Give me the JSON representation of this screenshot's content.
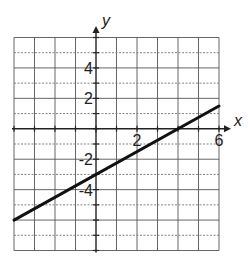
{
  "chart_data": {
    "type": "line",
    "title": "",
    "xlabel": "x",
    "ylabel": "y",
    "xlim": [
      -4,
      6
    ],
    "ylim": [
      -8,
      6
    ],
    "grid": true,
    "grid_step": 1,
    "x_tick_labels": [
      {
        "value": 2,
        "label": "2"
      },
      {
        "value": 6,
        "label": "6"
      }
    ],
    "y_tick_labels": [
      {
        "value": 4,
        "label": "4"
      },
      {
        "value": 2,
        "label": "2"
      },
      {
        "value": -2,
        "label": "-2"
      },
      {
        "value": -4,
        "label": "-4"
      }
    ],
    "series": [
      {
        "name": "line",
        "equation": "y = 0.75x - 3",
        "x": [
          -4,
          6
        ],
        "y": [
          -6,
          1.5
        ],
        "color": "#111111"
      }
    ]
  }
}
